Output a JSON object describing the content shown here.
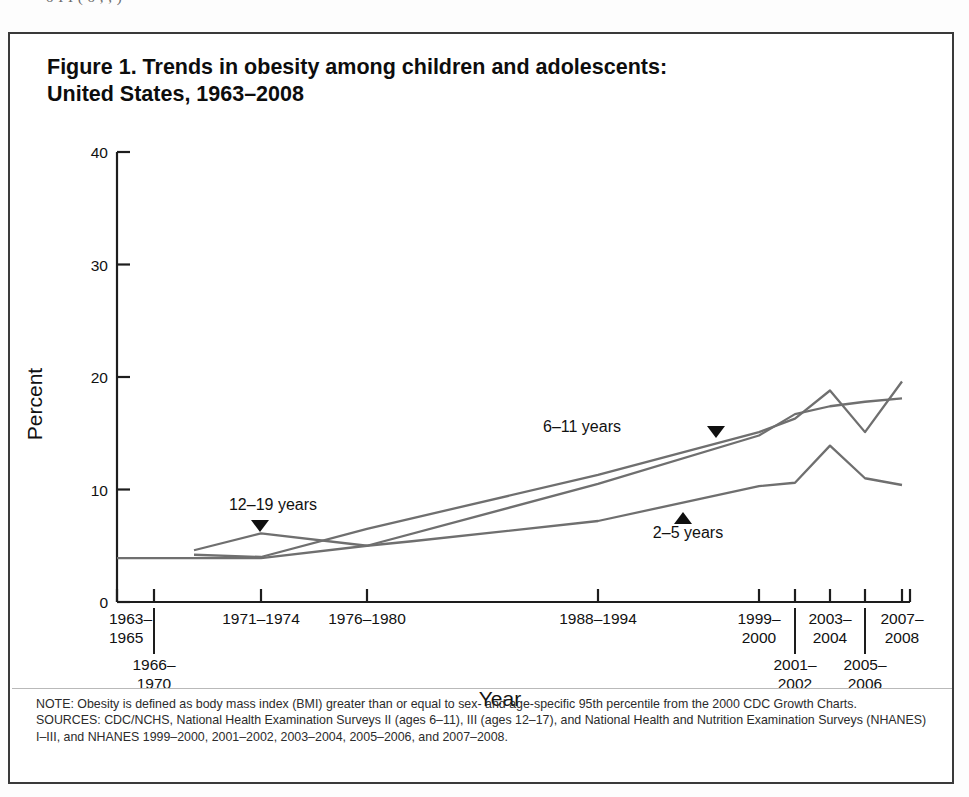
{
  "page": {
    "clipped_header_text": "o   I I                    (       o     ,  , )"
  },
  "figure": {
    "title_line1": "Figure 1. Trends in obesity among children and adolescents:",
    "title_line2": "United States, 1963–2008",
    "note": "NOTE: Obesity is defined as body mass index (BMI) greater than or equal to sex- and age-specific 95th percentile from the 2000 CDC Growth Charts.",
    "sources": "SOURCES: CDC/NCHS, National Health Examination Surveys II (ages 6–11), III (ages 12–17), and National Health and Nutrition Examination Surveys (NHANES) I–III, and NHANES 1999–2000, 2001–2002, 2003–2004, 2005–2006, and 2007–2008."
  },
  "chart_data": {
    "type": "line",
    "title": "Figure 1. Trends in obesity among children and adolescents: United States, 1963–2008",
    "xlabel": "Year",
    "ylabel": "Percent",
    "ylim": [
      0,
      40
    ],
    "yticks": [
      0,
      10,
      20,
      30,
      40
    ],
    "grid": false,
    "legend": "inline-labels",
    "x_tick_labels": [
      {
        "id": "t1963",
        "line1": "1963–",
        "line2": "1965",
        "row": "upper",
        "x_px": 115
      },
      {
        "id": "t1966",
        "line1": "1966–",
        "line2": "1970",
        "row": "lower",
        "x_px": 152
      },
      {
        "id": "t1971",
        "line1": "1971–1974",
        "line2": "",
        "row": "upper",
        "x_px": 259
      },
      {
        "id": "t1976",
        "line1": "1976–1980",
        "line2": "",
        "row": "upper",
        "x_px": 365
      },
      {
        "id": "t1988",
        "line1": "1988–1994",
        "line2": "",
        "row": "upper",
        "x_px": 596
      },
      {
        "id": "t1999",
        "line1": "1999–",
        "line2": "2000",
        "row": "upper",
        "x_px": 757
      },
      {
        "id": "t2001",
        "line1": "2001–",
        "line2": "2002",
        "row": "lower",
        "x_px": 793
      },
      {
        "id": "t2003",
        "line1": "2003–",
        "line2": "2004",
        "row": "upper",
        "x_px": 828
      },
      {
        "id": "t2005",
        "line1": "2005–",
        "line2": "2006",
        "row": "lower",
        "x_px": 863
      },
      {
        "id": "t2007",
        "line1": "2007–",
        "line2": "2008",
        "row": "upper",
        "x_px": 900
      }
    ],
    "series": [
      {
        "name": "2–5 years",
        "label": "2–5 years",
        "marker": "triangle-up",
        "marker_at": {
          "x_px": 681,
          "y_px": 513
        },
        "label_at": {
          "x_px": 686,
          "y_px": 536
        },
        "x_px": [
          115,
          259,
          365,
          410,
          596,
          757,
          793,
          828,
          863,
          900
        ],
        "values": [
          3.9,
          3.9,
          5.0,
          5.4,
          7.2,
          10.3,
          10.6,
          13.9,
          11.0,
          10.4
        ]
      },
      {
        "name": "6–11 years",
        "label": "6–11 years",
        "marker": "triangle-down",
        "marker_at": {
          "x_px": 714,
          "y_px": 433
        },
        "label_at": {
          "x_px": 580,
          "y_px": 430
        },
        "x_px": [
          192,
          259,
          365,
          596,
          757,
          793,
          828,
          863,
          900
        ],
        "values": [
          4.2,
          4.0,
          6.5,
          11.3,
          15.1,
          16.3,
          18.8,
          15.1,
          19.6
        ]
      },
      {
        "name": "12–19 years",
        "label": "12–19 years",
        "marker": "triangle-down",
        "marker_at": {
          "x_px": 258,
          "y_px": 527
        },
        "label_at": {
          "x_px": 271,
          "y_px": 508
        },
        "x_px": [
          192,
          259,
          365,
          596,
          757,
          793,
          828,
          863,
          900
        ],
        "values": [
          4.6,
          6.1,
          5.0,
          10.5,
          14.8,
          16.7,
          17.4,
          17.8,
          18.1
        ]
      }
    ]
  }
}
